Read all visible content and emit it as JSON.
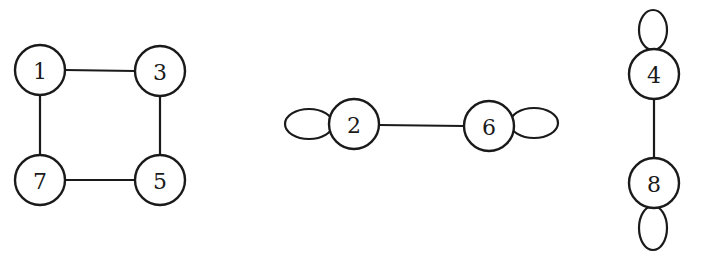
{
  "diagram": {
    "type": "graph",
    "nodes": [
      {
        "id": "1",
        "label": "1",
        "cx": 40,
        "cy": 70
      },
      {
        "id": "3",
        "label": "3",
        "cx": 160,
        "cy": 71
      },
      {
        "id": "7",
        "label": "7",
        "cx": 40,
        "cy": 180
      },
      {
        "id": "5",
        "label": "5",
        "cx": 160,
        "cy": 180
      },
      {
        "id": "2",
        "label": "2",
        "cx": 354,
        "cy": 124
      },
      {
        "id": "6",
        "label": "6",
        "cx": 489,
        "cy": 126
      },
      {
        "id": "4",
        "label": "4",
        "cx": 654,
        "cy": 74
      },
      {
        "id": "8",
        "label": "8",
        "cx": 654,
        "cy": 183
      }
    ],
    "edges": [
      {
        "from": "1",
        "to": "3"
      },
      {
        "from": "1",
        "to": "7"
      },
      {
        "from": "3",
        "to": "5"
      },
      {
        "from": "7",
        "to": "5"
      },
      {
        "from": "2",
        "to": "6"
      },
      {
        "from": "4",
        "to": "8"
      }
    ],
    "self_loops": [
      {
        "node": "2",
        "side": "left"
      },
      {
        "node": "6",
        "side": "right"
      },
      {
        "node": "4",
        "side": "top"
      },
      {
        "node": "8",
        "side": "bottom"
      }
    ],
    "node_radius": 25
  }
}
